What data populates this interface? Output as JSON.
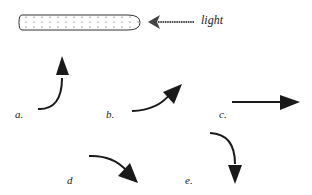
{
  "diagram": {
    "stem_label": "",
    "light_label": "light",
    "options": [
      {
        "id": "a",
        "label": "a.",
        "description": "curve bending upward"
      },
      {
        "id": "b",
        "label": "b.",
        "description": "curve bending up-right"
      },
      {
        "id": "c",
        "label": "c.",
        "description": "straight horizontal right"
      },
      {
        "id": "d",
        "label": "d",
        "description": "curve bending down-right"
      },
      {
        "id": "e",
        "label": "e.",
        "description": "curve bending downward"
      }
    ],
    "colors": {
      "ink": "#1a1a1a",
      "background": "#ffffff"
    }
  }
}
